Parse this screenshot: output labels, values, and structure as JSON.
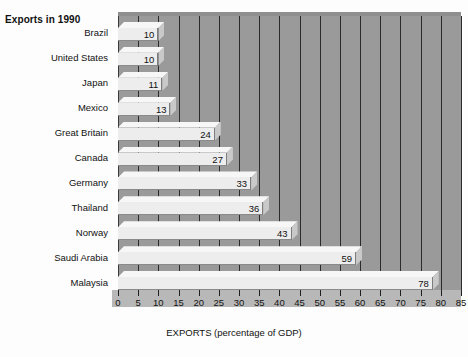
{
  "chart_data": {
    "type": "bar",
    "orientation": "horizontal",
    "title": "Exports in 1990",
    "xlabel": "EXPORTS (percentage of GDP)",
    "ylabel": "",
    "categories": [
      "Brazil",
      "United States",
      "Japan",
      "Mexico",
      "Great Britain",
      "Canada",
      "Germany",
      "Thailand",
      "Norway",
      "Saudi Arabia",
      "Malaysia"
    ],
    "values": [
      10,
      10,
      11,
      13,
      24,
      27,
      33,
      36,
      43,
      59,
      78
    ],
    "xlim": [
      0,
      85
    ],
    "xticks": [
      0,
      5,
      10,
      15,
      20,
      25,
      30,
      35,
      40,
      45,
      50,
      55,
      60,
      65,
      70,
      75,
      80,
      85
    ],
    "xtick_labels": [
      "0",
      "5",
      "10",
      "15",
      "20",
      "25",
      "30",
      "35",
      "40",
      "45",
      "50",
      "55",
      "60",
      "65",
      "70",
      "75",
      "80",
      "85"
    ],
    "grid": true,
    "grid_axis": "x",
    "legend": false,
    "data_labels": true,
    "style_3d": true,
    "colors": {
      "plot_background": "#9a9a9a",
      "gridline": "#2b2b2b",
      "bar_face": "#ededed",
      "bar_top": "#f7f7f7",
      "bar_side": "#c9c9c9",
      "page_background": "#fdfdfd",
      "text": "#111111"
    }
  }
}
